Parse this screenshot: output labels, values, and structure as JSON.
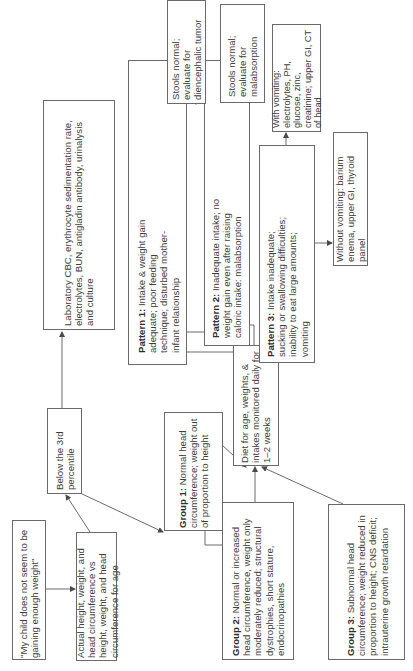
{
  "diagram": {
    "orientation": "rotated-90-ccw",
    "line_color": "#6a6a6a",
    "nodes": {
      "complaint": {
        "text": "\"My child does not seem to be gaining enough weight\""
      },
      "measurement": {
        "text": "Actual height, weight, and head circumference vs height, weight, and head circumference for age"
      },
      "below_3rd": {
        "text": "Below the 3rd percentile"
      },
      "laboratory": {
        "text": "Laboratory CBC, erythrocyte sedimentation rate, electrolytes, BUN, antigladin antibody, urinalysis and culture"
      },
      "group1": {
        "label": "Group 1:",
        "text": " Normal head circumference; weight out of proportion to height"
      },
      "group2": {
        "label": "Group 2:",
        "text": " Normal or increased head circumference, weight only moderately reduced; structural dystrophies, short stature, endocrinopathies"
      },
      "group3": {
        "label": "Group 3:",
        "text": " Subnormal head circumference; weight reduced in proportion to height; CNS deficit; intrauterine growth retardation"
      },
      "diet": {
        "text": "Diet for age, weights, & intakes monitored daily for 1–2 weeks"
      },
      "pattern1": {
        "label": "Pattern 1:",
        "text": " Intake & weight gain adequate; poor feeding technique; disturbed mother-infant relationship"
      },
      "pattern2": {
        "label": "Pattern 2:",
        "text": " Inadequate intake; no weight gain even after raising caloric intake: malabsorption"
      },
      "pattern3": {
        "label": "Pattern 3:",
        "text": " Intake inadequate; sucking or swallowing difficulties; inability to eat large amounts; vomiting"
      },
      "stools_tumor": {
        "text": "Stools normal; evaluate for diencephalic tumor"
      },
      "stools_malabsorption": {
        "text": "Stools normal; evaluate for malabsorption"
      },
      "with_vomiting": {
        "text": "With vomiting: electrolytes, PH, glucose, zinc, creatinine; upper GI, CT of head"
      },
      "without_vomiting": {
        "text": "Without vomiting: barium enema, upper GI, thyroid panel"
      }
    }
  }
}
